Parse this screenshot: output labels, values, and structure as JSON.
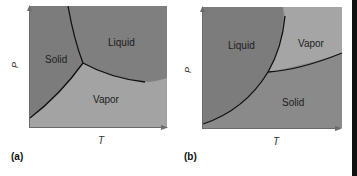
{
  "figure": {
    "panels": [
      {
        "id": "a",
        "caption": "(a)",
        "xlabel": "T",
        "ylabel": "P",
        "regions": [
          {
            "label": "Solid",
            "color": "#7e7e7e"
          },
          {
            "label": "Liquid",
            "color": "#7e7e7e"
          },
          {
            "label": "Vapor",
            "color": "#a3a3a3"
          }
        ]
      },
      {
        "id": "b",
        "caption": "(b)",
        "xlabel": "T",
        "ylabel": "P",
        "regions": [
          {
            "label": "Liquid",
            "color": "#7e7e7e"
          },
          {
            "label": "Vapor",
            "color": "#a3a3a3"
          },
          {
            "label": "Solid",
            "color": "#8a8a8a"
          }
        ]
      }
    ],
    "colors": {
      "dark_region": "#7e7e7e",
      "light_region": "#a3a3a3",
      "curve": "#111111",
      "axis": "#6a6a6a"
    }
  }
}
